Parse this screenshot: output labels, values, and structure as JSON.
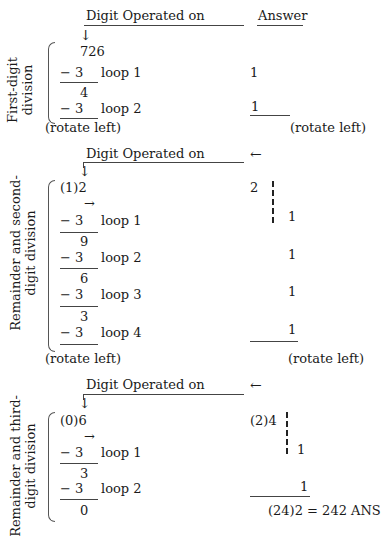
{
  "section1": {
    "header": "Digit Operated on",
    "answer_header": "Answer",
    "side_label_line1": "First-digit",
    "side_label_line2": "division",
    "arrow_down": "↓",
    "number": "726",
    "sub1": "− 3",
    "loop1": "loop 1",
    "ans1": "1",
    "rem1": "4",
    "sub2": "− 3",
    "loop2": "loop 2",
    "ans2": "1",
    "rotate_left": "(rotate left)",
    "rotate_left_answer": "(rotate left)"
  },
  "section2": {
    "header": "Digit Operated on",
    "arrow_left": "←",
    "arrow_down": "↓",
    "arrow_right": "→",
    "side_label_line1": "Remainder and second-",
    "side_label_line2": "digit division",
    "number": "(1)2",
    "ans_top": "2",
    "sub1": "− 3",
    "loop1": "loop 1",
    "ans1": "1",
    "rem1": "9",
    "sub2": "− 3",
    "loop2": "loop 2",
    "ans2": "1",
    "rem2": "6",
    "sub3": "− 3",
    "loop3": "loop 3",
    "ans3": "1",
    "rem3": "3",
    "sub4": "− 3",
    "loop4": "loop 4",
    "ans4": "1",
    "rotate_left": "(rotate left)",
    "rotate_left_answer": "(rotate left)"
  },
  "section3": {
    "header": "Digit Operated on",
    "arrow_left": "←",
    "arrow_down": "↓",
    "arrow_right": "→",
    "side_label_line1": "Remainder and third-",
    "side_label_line2": "digit division",
    "number": "(0)6",
    "ans_top": "(2)4",
    "sub1": "− 3",
    "loop1": "loop 1",
    "ans1": "1",
    "rem1": "3",
    "sub2": "− 3",
    "loop2": "loop 2",
    "ans2": "1",
    "rem2": "0",
    "final_answer": "(24)2 = 242 ANS"
  }
}
